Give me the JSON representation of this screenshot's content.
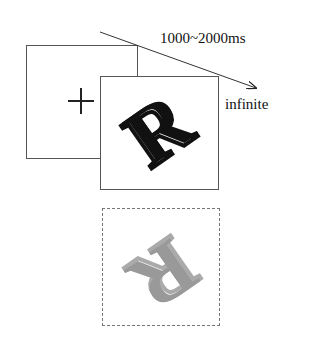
{
  "diagram": {
    "type": "experimental-trial-sequence",
    "frames": [
      {
        "name": "fixation",
        "content": "+",
        "duration_label": "1000~2000ms"
      },
      {
        "name": "stimulus",
        "content": "rotated letter R",
        "duration_label": "infinite"
      },
      {
        "name": "mirrored-stimulus",
        "content": "mirrored rotated letter R (gray, dashed frame)"
      }
    ],
    "labels": {
      "duration1": "1000~2000ms",
      "duration2": "infinite",
      "fixation": "+",
      "letter": "R"
    },
    "colors": {
      "line": "#555555",
      "letter": "#111111",
      "mirror_letter": "#999999"
    }
  }
}
